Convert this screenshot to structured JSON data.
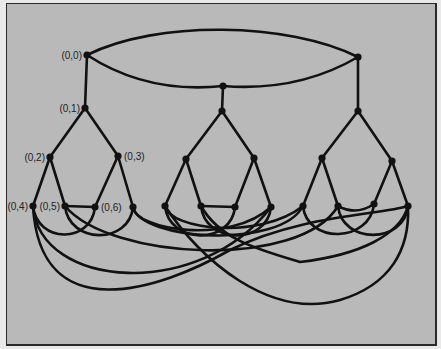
{
  "diagram": {
    "title": "",
    "colors": {
      "background": "#b9b9b9",
      "stroke": "#111111",
      "text": "#222222"
    },
    "nodes": [
      {
        "id": "n00",
        "label": "(0,0)",
        "x": 87,
        "y": 55
      },
      {
        "id": "n01",
        "label": "(0,1)",
        "x": 85,
        "y": 108
      },
      {
        "id": "n02",
        "label": "(0,2)",
        "x": 50,
        "y": 157
      },
      {
        "id": "n03",
        "label": "(0,3)",
        "x": 118,
        "y": 156
      },
      {
        "id": "n04",
        "label": "(0,4)",
        "x": 33,
        "y": 206
      },
      {
        "id": "n05",
        "label": "(0,5)",
        "x": 65,
        "y": 206
      },
      {
        "id": "n06",
        "label": "(0,6)",
        "x": 95,
        "y": 207
      },
      {
        "id": "n07",
        "label": "",
        "x": 133,
        "y": 207
      },
      {
        "id": "m0",
        "label": "",
        "x": 223,
        "y": 86
      },
      {
        "id": "m1",
        "label": "",
        "x": 222,
        "y": 111
      },
      {
        "id": "m2",
        "label": "",
        "x": 186,
        "y": 159
      },
      {
        "id": "m3",
        "label": "",
        "x": 254,
        "y": 158
      },
      {
        "id": "m4",
        "label": "",
        "x": 165,
        "y": 206
      },
      {
        "id": "m5",
        "label": "",
        "x": 201,
        "y": 206
      },
      {
        "id": "m6",
        "label": "",
        "x": 235,
        "y": 207
      },
      {
        "id": "m7",
        "label": "",
        "x": 271,
        "y": 207
      },
      {
        "id": "r0",
        "label": "",
        "x": 358,
        "y": 57
      },
      {
        "id": "r1",
        "label": "",
        "x": 358,
        "y": 111
      },
      {
        "id": "r2",
        "label": "",
        "x": 322,
        "y": 158
      },
      {
        "id": "r3",
        "label": "",
        "x": 392,
        "y": 161
      },
      {
        "id": "r4",
        "label": "",
        "x": 303,
        "y": 206
      },
      {
        "id": "r5",
        "label": "",
        "x": 338,
        "y": 206
      },
      {
        "id": "r6",
        "label": "",
        "x": 374,
        "y": 204
      },
      {
        "id": "r7",
        "label": "",
        "x": 408,
        "y": 206
      }
    ],
    "edges": [
      {
        "from": "n00",
        "to": "r0",
        "curve": "upper-arc"
      },
      {
        "from": "n00",
        "to": "m0",
        "curve": "lower-arc-left"
      },
      {
        "from": "m0",
        "to": "r0",
        "curve": "lower-arc-right"
      },
      {
        "from": "n00",
        "to": "n01"
      },
      {
        "from": "m0",
        "to": "m1"
      },
      {
        "from": "r0",
        "to": "r1"
      },
      {
        "from": "n01",
        "to": "n02"
      },
      {
        "from": "n01",
        "to": "n03"
      },
      {
        "from": "n02",
        "to": "n04"
      },
      {
        "from": "n02",
        "to": "n05"
      },
      {
        "from": "n03",
        "to": "n06"
      },
      {
        "from": "n03",
        "to": "n07"
      },
      {
        "from": "m1",
        "to": "m2"
      },
      {
        "from": "m1",
        "to": "m3"
      },
      {
        "from": "m2",
        "to": "m4"
      },
      {
        "from": "m2",
        "to": "m5"
      },
      {
        "from": "m3",
        "to": "m6"
      },
      {
        "from": "m3",
        "to": "m7"
      },
      {
        "from": "r1",
        "to": "r2"
      },
      {
        "from": "r1",
        "to": "r3"
      },
      {
        "from": "r2",
        "to": "r4"
      },
      {
        "from": "r2",
        "to": "r5"
      },
      {
        "from": "r3",
        "to": "r6"
      },
      {
        "from": "r3",
        "to": "r7"
      },
      {
        "from": "n05",
        "to": "n06",
        "curve": "straight"
      },
      {
        "from": "m5",
        "to": "m6",
        "curve": "straight"
      },
      {
        "from": "r5",
        "to": "r6",
        "curve": "sag"
      },
      {
        "from": "n04",
        "to": "n06",
        "curve": "arc"
      },
      {
        "from": "m4",
        "to": "m6",
        "curve": "arc"
      },
      {
        "from": "r4",
        "to": "r6",
        "curve": "arc"
      },
      {
        "from": "n05",
        "to": "n07",
        "curve": "arc"
      },
      {
        "from": "m5",
        "to": "m7",
        "curve": "arc"
      },
      {
        "from": "r5",
        "to": "r7",
        "curve": "arc"
      },
      {
        "from": "n07",
        "to": "r4",
        "curve": "long-arc"
      },
      {
        "from": "n07",
        "to": "m7",
        "curve": "long-arc"
      },
      {
        "from": "n04",
        "to": "m7",
        "curve": "long-arc"
      },
      {
        "from": "n05",
        "to": "r5",
        "curve": "long-arc"
      },
      {
        "from": "n04",
        "to": "r7",
        "curve": "deep-arc-left"
      },
      {
        "from": "m4",
        "to": "r7",
        "curve": "deep-arc-right"
      },
      {
        "from": "m5",
        "to": "r7",
        "curve": "crossing"
      },
      {
        "from": "m4",
        "to": "r4",
        "curve": "long-arc"
      }
    ]
  }
}
